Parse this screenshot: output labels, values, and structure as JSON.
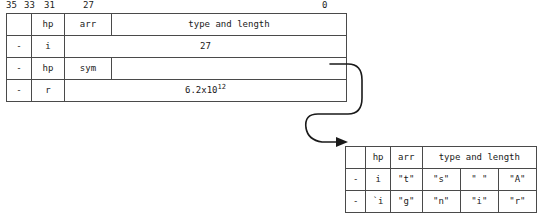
{
  "figure": {
    "kind": "word-format-memory-diagram",
    "ink_color": "#1a1a1a",
    "line_color": "#4a4a4a"
  },
  "bit_ruler": {
    "labels": [
      "35",
      "33",
      "31",
      "27",
      "0"
    ]
  },
  "table1": {
    "columns": [
      "flag",
      "hp",
      "tag",
      "body"
    ],
    "rows": [
      {
        "flag": "",
        "hp": "hp",
        "tag": "arr",
        "body": "type and length",
        "body_align": "center"
      },
      {
        "flag": "-",
        "hp": "i",
        "tag": "",
        "body": "27",
        "body_align": "right"
      },
      {
        "flag": "-",
        "hp": "hp",
        "tag": "sym",
        "body": "",
        "body_align": "center"
      },
      {
        "flag": "-",
        "hp": "r",
        "tag": "",
        "body": "6.2x10",
        "body_sup": "12",
        "body_align": "right"
      }
    ]
  },
  "table2": {
    "header": {
      "flag": "",
      "hp": "hp",
      "arr": "arr",
      "type_and_length": "type and length"
    },
    "rows": [
      {
        "flag": "-",
        "hp": "i",
        "chars": [
          "\"t\"",
          "\"s\"",
          "\" \"",
          "\"A\""
        ]
      },
      {
        "flag": "-",
        "hp": "`i",
        "chars": [
          "\"g\"",
          "\"n\"",
          "\"i\"",
          "\"r\""
        ]
      }
    ]
  },
  "connector": {
    "name": "sym-pointer-arrow",
    "from": "table1 sym row right edge",
    "to": "table2 left edge",
    "arrowhead": "right"
  }
}
